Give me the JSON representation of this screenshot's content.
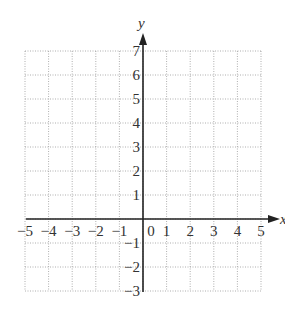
{
  "diagram": {
    "type": "coordinate-plane",
    "x_axis": {
      "label": "x",
      "min": -5,
      "max": 5,
      "ticks": [
        "−5",
        "−4",
        "−3",
        "−2",
        "−1",
        "0",
        "1",
        "2",
        "3",
        "4",
        "5"
      ]
    },
    "y_axis": {
      "label": "y",
      "min": -3,
      "max": 7,
      "ticks": [
        "7",
        "6",
        "5",
        "4",
        "3",
        "2",
        "1",
        "−1",
        "−2",
        "−3"
      ]
    },
    "grid": {
      "style": "dotted",
      "color": "#9a9a9a"
    },
    "axis_color": "#222222"
  }
}
